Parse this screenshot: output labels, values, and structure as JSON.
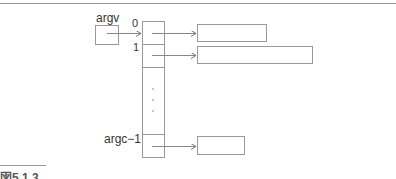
{
  "diagram": {
    "type": "pointer-array",
    "argv_label": "argv",
    "index_labels": {
      "first": "0",
      "second": "1",
      "last": "argc−1"
    },
    "ellipsis": "⋮",
    "targets": [
      {
        "index": "0",
        "kind": "string-box"
      },
      {
        "index": "1",
        "kind": "string-box"
      },
      {
        "index": "argc−1",
        "kind": "string-box"
      }
    ],
    "colors": {
      "line": "#888888",
      "box_border": "#999999",
      "text": "#333333",
      "rule": "#999999"
    }
  },
  "caption": {
    "text": "図5.1.3"
  }
}
